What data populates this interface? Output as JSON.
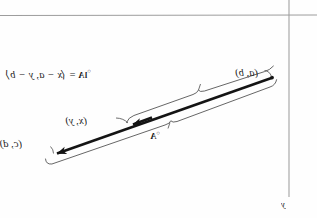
{
  "figure": {
    "kind": "vector-diagram",
    "orientation": "mirrored-horizontally",
    "background_color": "#fefefe",
    "ink_color": "#1b1b1b",
    "rule_color": "#9a9a9a",
    "labels": {
      "point_ab": "(a, b)",
      "point_cd": "(c, d)",
      "point_xy": "(x, y)",
      "equation": "lA₀ = ⟨x − a, y − b⟩",
      "equation_lhs": "lA",
      "equation_lhs_sup": "○",
      "equation_rel": "=",
      "equation_rhs": "⟨x − a, y − b⟩",
      "vector_A": "A",
      "vector_A_sup": "○",
      "axis_y": "y"
    },
    "rules": {
      "horizontal_rule_y": 15,
      "vertical_rule_x": 289,
      "vertical_rule_y_end": 197
    },
    "geometry": {
      "main_vector_start": [
        271,
        78
      ],
      "main_vector_end": [
        52,
        155
      ],
      "mid_arrow_tip": [
        128,
        126
      ],
      "upper_brace_from": [
        272,
        72
      ],
      "upper_brace_to": [
        128,
        120
      ],
      "lower_brace_from": [
        270,
        86
      ],
      "lower_brace_to": [
        48,
        164
      ]
    }
  }
}
